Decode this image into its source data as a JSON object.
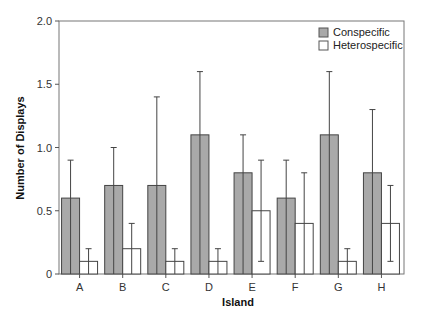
{
  "chart_data": {
    "type": "bar",
    "title": "",
    "xlabel": "Island",
    "ylabel": "Number of Displays",
    "ylim": [
      0,
      2.0
    ],
    "yticks": [
      0,
      0.5,
      1.0,
      1.5,
      2.0
    ],
    "ytick_labels": [
      "0",
      "0.5",
      "1.0",
      "1.5",
      "2.0"
    ],
    "grid": false,
    "legend_position": "upper right",
    "categories": [
      "A",
      "B",
      "C",
      "D",
      "E",
      "F",
      "G",
      "H"
    ],
    "series": [
      {
        "name": "Conspecific",
        "color": "#a9a9a9",
        "values": [
          0.6,
          0.7,
          0.7,
          1.1,
          0.8,
          0.6,
          1.1,
          0.8
        ],
        "error_upper": [
          0.9,
          1.0,
          1.4,
          1.6,
          1.1,
          0.9,
          1.6,
          1.3
        ],
        "error_lower": [
          null,
          null,
          null,
          null,
          null,
          null,
          null,
          null
        ]
      },
      {
        "name": "Heterospecific",
        "color": "#ffffff",
        "values": [
          0.1,
          0.2,
          0.1,
          0.1,
          0.5,
          0.4,
          0.1,
          0.4
        ],
        "error_upper": [
          0.2,
          0.4,
          0.2,
          0.2,
          0.9,
          0.8,
          0.2,
          0.7
        ],
        "error_lower": [
          null,
          null,
          null,
          null,
          0.1,
          null,
          null,
          0.1
        ]
      }
    ]
  },
  "legend": {
    "items": [
      {
        "label": "Conspecific"
      },
      {
        "label": "Heterospecific"
      }
    ]
  },
  "axes": {
    "x_title": "Island",
    "y_title": "Number of Displays"
  }
}
